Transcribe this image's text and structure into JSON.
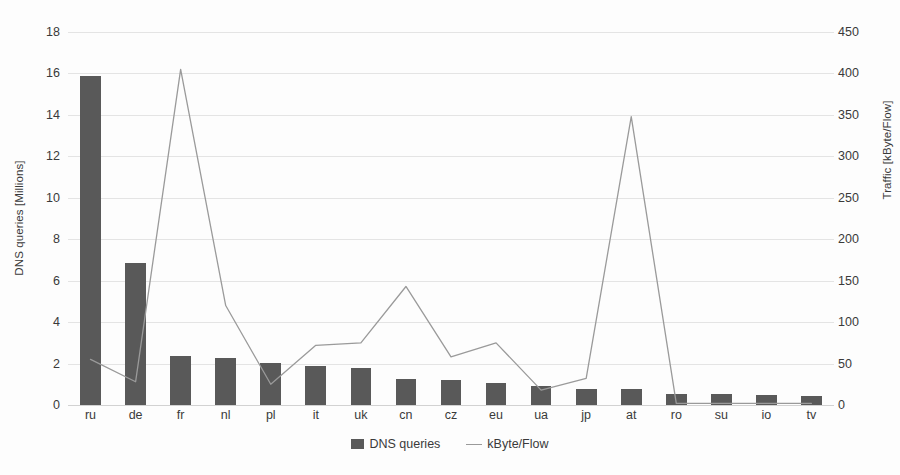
{
  "chart_data": {
    "type": "bar",
    "title": "",
    "categories": [
      "ru",
      "de",
      "fr",
      "nl",
      "pl",
      "it",
      "uk",
      "cn",
      "cz",
      "eu",
      "ua",
      "jp",
      "at",
      "ro",
      "su",
      "io",
      "tv"
    ],
    "series": [
      {
        "name": "DNS queries",
        "kind": "bar",
        "axis": "left",
        "color": "#595959",
        "values": [
          15.9,
          6.85,
          2.35,
          2.25,
          2.05,
          1.9,
          1.8,
          1.25,
          1.2,
          1.05,
          0.9,
          0.75,
          0.75,
          0.55,
          0.55,
          0.5,
          0.45
        ]
      },
      {
        "name": "kByte/Flow",
        "kind": "line",
        "axis": "right",
        "color": "#9a9a9a",
        "values": [
          55,
          28,
          405,
          120,
          25,
          72,
          75,
          143,
          58,
          75,
          18,
          32,
          348,
          2,
          2,
          2,
          2
        ]
      }
    ],
    "xlabel": "",
    "ylabel": "DNS queries [Millions]",
    "y2label": "Traffic [kByte/Flow]",
    "ylim": [
      0,
      18
    ],
    "y2lim": [
      0,
      450
    ],
    "yticks": [
      0,
      2,
      4,
      6,
      8,
      10,
      12,
      14,
      16,
      18
    ],
    "y2ticks": [
      0,
      50,
      100,
      150,
      200,
      250,
      300,
      350,
      400,
      450
    ],
    "grid": true,
    "legend_position": "bottom-center"
  },
  "axes": {
    "left": {
      "title": "DNS queries [Millions]",
      "tick_labels": [
        "0",
        "2",
        "4",
        "6",
        "8",
        "10",
        "12",
        "14",
        "16",
        "18"
      ]
    },
    "right": {
      "title": "Traffic [kByte/Flow]",
      "tick_labels": [
        "0",
        "50",
        "100",
        "150",
        "200",
        "250",
        "300",
        "350",
        "400",
        "450"
      ]
    },
    "category_labels": [
      "ru",
      "de",
      "fr",
      "nl",
      "pl",
      "it",
      "uk",
      "cn",
      "cz",
      "eu",
      "ua",
      "jp",
      "at",
      "ro",
      "su",
      "io",
      "tv"
    ]
  },
  "legend": {
    "items": [
      {
        "label": "DNS queries",
        "marker": "bar-swatch",
        "color": "#595959"
      },
      {
        "label": "kByte/Flow",
        "marker": "line-swatch",
        "color": "#9a9a9a"
      }
    ]
  },
  "colors": {
    "bar": "#595959",
    "line": "#9a9a9a",
    "grid": "#e4e4e4",
    "text": "#3a3a3a",
    "background": "#fdfdfd"
  }
}
